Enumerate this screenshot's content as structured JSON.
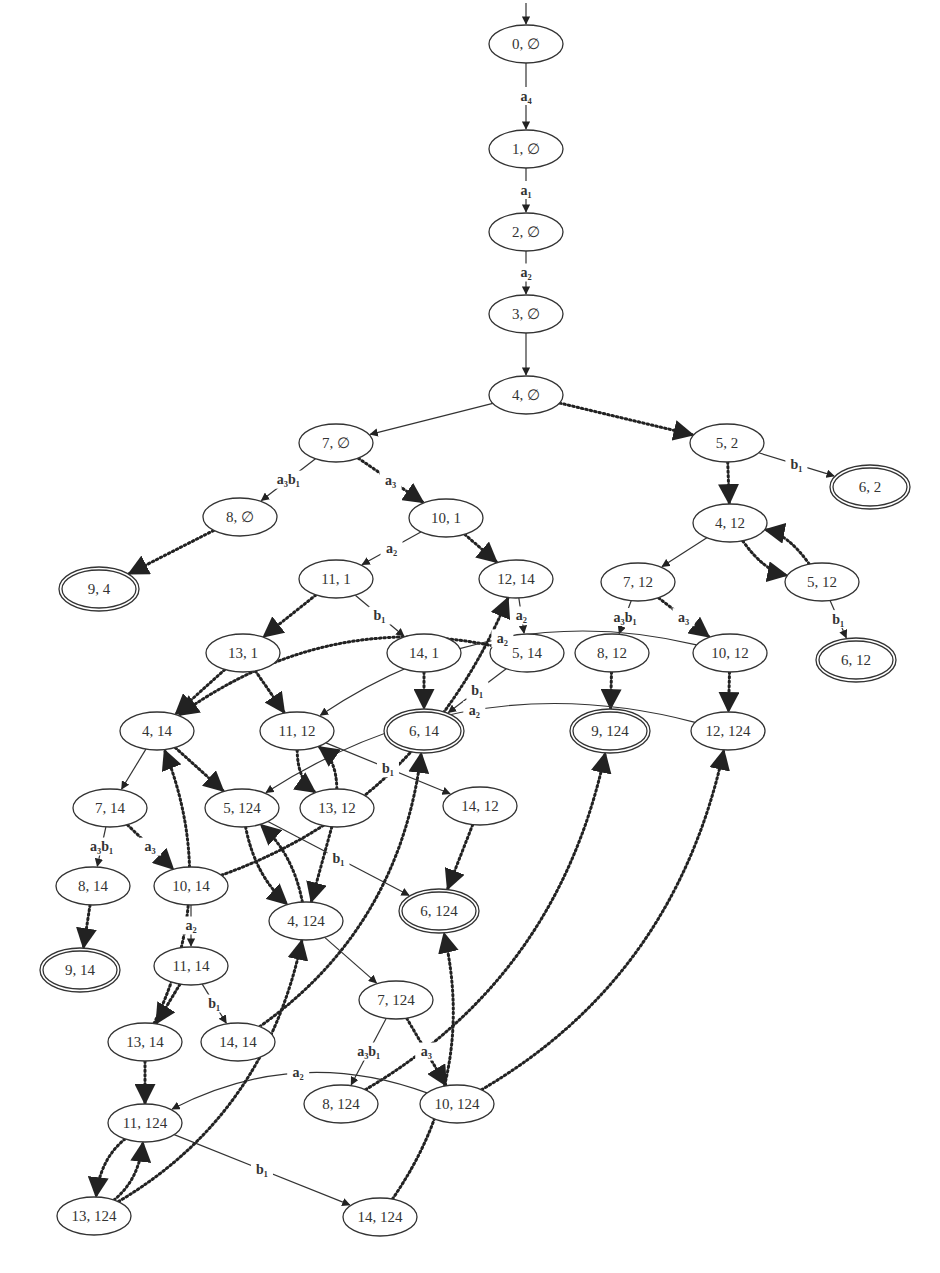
{
  "diagram": {
    "title": "",
    "colors": {
      "background": "#ffffff",
      "stroke": "#333333"
    },
    "nodes": [
      {
        "id": "n0_0",
        "label": "0, ∅",
        "x": 526,
        "y": 44,
        "final": false,
        "initial": true
      },
      {
        "id": "n1_0",
        "label": "1, ∅",
        "x": 526,
        "y": 149,
        "final": false
      },
      {
        "id": "n2_0",
        "label": "2, ∅",
        "x": 526,
        "y": 232,
        "final": false
      },
      {
        "id": "n3_0",
        "label": "3, ∅",
        "x": 526,
        "y": 314,
        "final": false
      },
      {
        "id": "n4_0",
        "label": "4, ∅",
        "x": 526,
        "y": 395,
        "final": false
      },
      {
        "id": "n7_0",
        "label": "7, ∅",
        "x": 336,
        "y": 443,
        "final": false
      },
      {
        "id": "n5_2",
        "label": "5, 2",
        "x": 727,
        "y": 443,
        "final": false
      },
      {
        "id": "n6_2",
        "label": "6, 2",
        "x": 870,
        "y": 487,
        "final": true
      },
      {
        "id": "n8_0",
        "label": "8, ∅",
        "x": 240,
        "y": 517,
        "final": false
      },
      {
        "id": "n10_1",
        "label": "10, 1",
        "x": 446,
        "y": 518,
        "final": false
      },
      {
        "id": "n4_12",
        "label": "4, 12",
        "x": 730,
        "y": 523,
        "final": false
      },
      {
        "id": "n9_4",
        "label": "9, 4",
        "x": 99,
        "y": 589,
        "final": true
      },
      {
        "id": "n11_1",
        "label": "11, 1",
        "x": 336,
        "y": 579,
        "final": false
      },
      {
        "id": "n12_14",
        "label": "12, 14",
        "x": 516,
        "y": 579,
        "final": false
      },
      {
        "id": "n7_12",
        "label": "7, 12",
        "x": 638,
        "y": 582,
        "final": false
      },
      {
        "id": "n5_12",
        "label": "5, 12",
        "x": 822,
        "y": 582,
        "final": false
      },
      {
        "id": "n13_1",
        "label": "13, 1",
        "x": 243,
        "y": 653,
        "final": false
      },
      {
        "id": "n14_1",
        "label": "14, 1",
        "x": 424,
        "y": 653,
        "final": false
      },
      {
        "id": "n5_14",
        "label": "5, 14",
        "x": 527,
        "y": 653,
        "final": false
      },
      {
        "id": "n8_12",
        "label": "8, 12",
        "x": 612,
        "y": 653,
        "final": false
      },
      {
        "id": "n10_12",
        "label": "10, 12",
        "x": 730,
        "y": 653,
        "final": false
      },
      {
        "id": "n6_12",
        "label": "6, 12",
        "x": 856,
        "y": 660,
        "final": true
      },
      {
        "id": "n4_14",
        "label": "4, 14",
        "x": 157,
        "y": 731,
        "final": false
      },
      {
        "id": "n11_12",
        "label": "11, 12",
        "x": 297,
        "y": 731,
        "final": false
      },
      {
        "id": "n6_14",
        "label": "6, 14",
        "x": 424,
        "y": 731,
        "final": true
      },
      {
        "id": "n9_124",
        "label": "9, 124",
        "x": 610,
        "y": 731,
        "final": true
      },
      {
        "id": "n12_124",
        "label": "12, 124",
        "x": 728,
        "y": 731,
        "final": false
      },
      {
        "id": "n7_14",
        "label": "7, 14",
        "x": 110,
        "y": 808,
        "final": false
      },
      {
        "id": "n5_124",
        "label": "5, 124",
        "x": 242,
        "y": 808,
        "final": false
      },
      {
        "id": "n13_12",
        "label": "13, 12",
        "x": 337,
        "y": 808,
        "final": false
      },
      {
        "id": "n14_12",
        "label": "14, 12",
        "x": 480,
        "y": 806,
        "final": false
      },
      {
        "id": "n8_14",
        "label": "8, 14",
        "x": 93,
        "y": 886,
        "final": false
      },
      {
        "id": "n10_14",
        "label": "10, 14",
        "x": 191,
        "y": 886,
        "final": false
      },
      {
        "id": "n4_124",
        "label": "4, 124",
        "x": 306,
        "y": 921,
        "final": false
      },
      {
        "id": "n6_124",
        "label": "6, 124",
        "x": 439,
        "y": 911,
        "final": true
      },
      {
        "id": "n9_14",
        "label": "9, 14",
        "x": 80,
        "y": 970,
        "final": true
      },
      {
        "id": "n11_14",
        "label": "11, 14",
        "x": 191,
        "y": 966,
        "final": false
      },
      {
        "id": "n7_124",
        "label": "7, 124",
        "x": 396,
        "y": 1000,
        "final": false
      },
      {
        "id": "n13_14",
        "label": "13, 14",
        "x": 145,
        "y": 1042,
        "final": false
      },
      {
        "id": "n14_14",
        "label": "14, 14",
        "x": 238,
        "y": 1042,
        "final": false
      },
      {
        "id": "n8_124",
        "label": "8, 124",
        "x": 341,
        "y": 1104,
        "final": false
      },
      {
        "id": "n10_124",
        "label": "10, 124",
        "x": 457,
        "y": 1104,
        "final": false
      },
      {
        "id": "n11_124",
        "label": "11, 124",
        "x": 145,
        "y": 1123,
        "final": false
      },
      {
        "id": "n13_124",
        "label": "13, 124",
        "x": 94,
        "y": 1216,
        "final": false
      },
      {
        "id": "n14_124",
        "label": "14, 124",
        "x": 380,
        "y": 1217,
        "final": false
      }
    ],
    "edges": [
      {
        "from": "n0_0",
        "to": "n1_0",
        "style": "solid",
        "label": "a₄"
      },
      {
        "from": "n1_0",
        "to": "n2_0",
        "style": "solid",
        "label": "a₁"
      },
      {
        "from": "n2_0",
        "to": "n3_0",
        "style": "solid",
        "label": "a₂"
      },
      {
        "from": "n3_0",
        "to": "n4_0",
        "style": "solid",
        "label": ""
      },
      {
        "from": "n4_0",
        "to": "n7_0",
        "style": "solid",
        "label": ""
      },
      {
        "from": "n4_0",
        "to": "n5_2",
        "style": "dotted",
        "label": ""
      },
      {
        "from": "n5_2",
        "to": "n6_2",
        "style": "solid",
        "label": "b₁"
      },
      {
        "from": "n5_2",
        "to": "n4_12",
        "style": "dotted",
        "label": ""
      },
      {
        "from": "n7_0",
        "to": "n8_0",
        "style": "solid",
        "label": "a₃b₁"
      },
      {
        "from": "n7_0",
        "to": "n10_1",
        "style": "dotted",
        "label": "a₃"
      },
      {
        "from": "n8_0",
        "to": "n9_4",
        "style": "dotted",
        "label": ""
      },
      {
        "from": "n10_1",
        "to": "n11_1",
        "style": "solid",
        "label": "a₂"
      },
      {
        "from": "n10_1",
        "to": "n12_14",
        "style": "dotted",
        "label": ""
      },
      {
        "from": "n4_12",
        "to": "n7_12",
        "style": "solid",
        "label": ""
      },
      {
        "from": "n4_12",
        "to": "n5_12",
        "style": "dotted",
        "label": ""
      },
      {
        "from": "n5_12",
        "to": "n4_12",
        "style": "dotted",
        "label": ""
      },
      {
        "from": "n5_12",
        "to": "n6_12",
        "style": "solid",
        "label": "b₁"
      },
      {
        "from": "n11_1",
        "to": "n13_1",
        "style": "dotted",
        "label": ""
      },
      {
        "from": "n11_1",
        "to": "n14_1",
        "style": "solid",
        "label": "b₁"
      },
      {
        "from": "n12_14",
        "to": "n5_14",
        "style": "solid",
        "label": "a₂"
      },
      {
        "from": "n5_14",
        "to": "n4_14",
        "style": "dotted",
        "label": ""
      },
      {
        "from": "n5_14",
        "to": "n6_14",
        "style": "solid",
        "label": "b₁"
      },
      {
        "from": "n14_1",
        "to": "n6_14",
        "style": "dotted",
        "label": ""
      },
      {
        "from": "n7_12",
        "to": "n8_12",
        "style": "solid",
        "label": "a₃b₁"
      },
      {
        "from": "n7_12",
        "to": "n10_12",
        "style": "dotted",
        "label": "a₃"
      },
      {
        "from": "n8_12",
        "to": "n9_124",
        "style": "dotted",
        "label": ""
      },
      {
        "from": "n10_12",
        "to": "n12_124",
        "style": "dotted",
        "label": ""
      },
      {
        "from": "n10_12",
        "to": "n11_12",
        "style": "solid",
        "label": "a₂"
      },
      {
        "from": "n12_124",
        "to": "n5_124",
        "style": "solid",
        "label": "a₂"
      },
      {
        "from": "n13_1",
        "to": "n4_14",
        "style": "dotted",
        "label": ""
      },
      {
        "from": "n13_1",
        "to": "n11_12",
        "style": "dotted",
        "label": ""
      },
      {
        "from": "n11_12",
        "to": "n13_12",
        "style": "dotted",
        "label": ""
      },
      {
        "from": "n13_12",
        "to": "n11_12",
        "style": "dotted",
        "label": ""
      },
      {
        "from": "n11_12",
        "to": "n14_12",
        "style": "solid",
        "label": "b₁"
      },
      {
        "from": "n13_12",
        "to": "n4_124",
        "style": "dotted",
        "label": ""
      },
      {
        "from": "n14_12",
        "to": "n6_124",
        "style": "dotted",
        "label": ""
      },
      {
        "from": "n4_14",
        "to": "n7_14",
        "style": "solid",
        "label": ""
      },
      {
        "from": "n4_14",
        "to": "n5_124",
        "style": "dotted",
        "label": ""
      },
      {
        "from": "n5_124",
        "to": "n4_124",
        "style": "dotted",
        "label": ""
      },
      {
        "from": "n4_124",
        "to": "n5_124",
        "style": "dotted",
        "label": ""
      },
      {
        "from": "n5_124",
        "to": "n6_124",
        "style": "solid",
        "label": "b₁"
      },
      {
        "from": "n7_14",
        "to": "n8_14",
        "style": "solid",
        "label": "a₃b₁"
      },
      {
        "from": "n7_14",
        "to": "n10_14",
        "style": "dotted",
        "label": "a₃"
      },
      {
        "from": "n8_14",
        "to": "n9_14",
        "style": "dotted",
        "label": ""
      },
      {
        "from": "n10_14",
        "to": "n11_14",
        "style": "solid",
        "label": "a₂"
      },
      {
        "from": "n10_14",
        "to": "n12_14",
        "style": "dotted",
        "label": ""
      },
      {
        "from": "n4_124",
        "to": "n7_124",
        "style": "solid",
        "label": ""
      },
      {
        "from": "n11_14",
        "to": "n13_14",
        "style": "dotted",
        "label": ""
      },
      {
        "from": "n11_14",
        "to": "n14_14",
        "style": "solid",
        "label": "b₁"
      },
      {
        "from": "n13_14",
        "to": "n4_14",
        "style": "dotted",
        "label": ""
      },
      {
        "from": "n13_14",
        "to": "n11_124",
        "style": "dotted",
        "label": ""
      },
      {
        "from": "n14_14",
        "to": "n6_14",
        "style": "dotted",
        "label": ""
      },
      {
        "from": "n7_124",
        "to": "n8_124",
        "style": "solid",
        "label": "a₃b₁"
      },
      {
        "from": "n7_124",
        "to": "n10_124",
        "style": "dotted",
        "label": "a₃"
      },
      {
        "from": "n8_124",
        "to": "n9_124",
        "style": "dotted",
        "label": ""
      },
      {
        "from": "n10_124",
        "to": "n12_124",
        "style": "dotted",
        "label": ""
      },
      {
        "from": "n10_124",
        "to": "n11_124",
        "style": "solid",
        "label": "a₂"
      },
      {
        "from": "n11_124",
        "to": "n13_124",
        "style": "dotted",
        "label": ""
      },
      {
        "from": "n13_124",
        "to": "n11_124",
        "style": "dotted",
        "label": ""
      },
      {
        "from": "n11_124",
        "to": "n14_124",
        "style": "solid",
        "label": "b₁"
      },
      {
        "from": "n13_124",
        "to": "n4_124",
        "style": "dotted",
        "label": ""
      },
      {
        "from": "n14_124",
        "to": "n6_124",
        "style": "dotted",
        "label": ""
      }
    ]
  }
}
